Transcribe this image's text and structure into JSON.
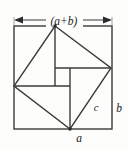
{
  "figure": {
    "kind": "geometric-diagram",
    "canvas": {
      "width": 129,
      "height": 150
    },
    "colors": {
      "background": "#fdfdfc",
      "stroke": "#3a3a3a",
      "stroke_dark": "#2b2b2b",
      "label": "#1a1a1a"
    },
    "labels": {
      "top_dimension": "(a+b)",
      "right_side": "b",
      "bottom_side": "a",
      "hypotenuse": "c"
    },
    "geometry": {
      "outer_square": {
        "name": "outer-square",
        "side_label": "(a+b)",
        "corners": [
          [
            14,
            26
          ],
          [
            112,
            26
          ],
          [
            112,
            129
          ],
          [
            14,
            129
          ]
        ]
      },
      "tilted_square": {
        "name": "tilted-square",
        "side_label": "c",
        "vertices": [
          [
            55,
            26
          ],
          [
            111,
            68
          ],
          [
            70,
            129
          ],
          [
            14,
            86
          ]
        ]
      },
      "pinwheel_lines": [
        {
          "name": "vertical-from-top-vertex",
          "x1": 55,
          "y1": 26,
          "x2": 55,
          "y2": 86
        },
        {
          "name": "horizontal-from-left-vertex",
          "x1": 14,
          "y1": 86,
          "x2": 70,
          "y2": 86
        },
        {
          "name": "vertical-to-bottom-vertex",
          "x1": 70,
          "y1": 68,
          "x2": 70,
          "y2": 129
        },
        {
          "name": "horizontal-to-right-vertex",
          "x1": 55,
          "y1": 68,
          "x2": 111,
          "y2": 68
        }
      ],
      "inner_square": {
        "name": "inner-square",
        "corners": [
          [
            55,
            68
          ],
          [
            70,
            68
          ],
          [
            70,
            86
          ],
          [
            55,
            86
          ]
        ],
        "side_label": ""
      },
      "dimension_arrow": {
        "name": "top-dimension-arrow",
        "y": 20,
        "x_left": 14,
        "x_right": 112
      }
    }
  }
}
